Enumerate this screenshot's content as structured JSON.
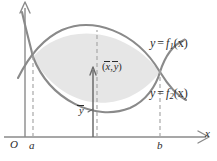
{
  "figure": {
    "type": "math-diagram",
    "axes": {
      "x_axis_label": "x",
      "y_axis_label": "",
      "origin_label": "O",
      "left_bound_label": "a",
      "right_bound_label": "b"
    },
    "labels": {
      "curve_upper_prefix": "y",
      "curve_upper_eq": "=",
      "curve_upper_fn": "f",
      "curve_upper_sub": "1",
      "curve_upper_arg": "(x)",
      "curve_upper_full": "y = f1(x)",
      "curve_lower_prefix": "y",
      "curve_lower_eq": "=",
      "curve_lower_fn": "f",
      "curve_lower_sub": "2",
      "curve_lower_arg": "(x)",
      "curve_lower_full": "y = f2(x)",
      "centroid_open": "(",
      "centroid_x": "x",
      "centroid_comma": ",",
      "centroid_y": "y",
      "centroid_close": ")",
      "centroid_full": "(x̄, ȳ)",
      "ybar": "y",
      "ybar_full": "ȳ"
    },
    "colors": {
      "region_fill": "#e6e6e6",
      "curve_stroke": "#8a8a8a",
      "axis_stroke": "#8a8a8a",
      "dashed_stroke": "#a8a8a8",
      "text": "#2b2b2b"
    },
    "geometry": {
      "x_axis_y": 137,
      "y_axis_x": 25,
      "a_x": 33,
      "b_x": 160,
      "centroid_x_px": 97,
      "centroid_y_px": 72
    }
  }
}
